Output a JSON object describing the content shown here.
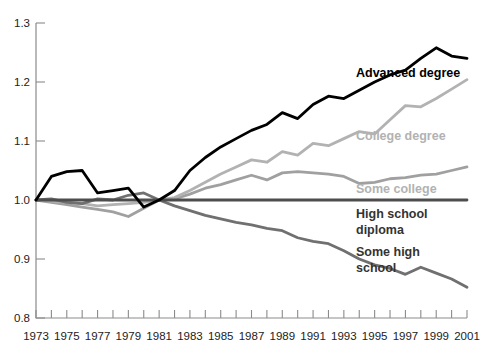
{
  "chart_data": {
    "type": "line",
    "title": "",
    "subtitle": "",
    "xlabel": "",
    "ylabel": "",
    "xlim": [
      1973,
      2001
    ],
    "ylim": [
      0.8,
      1.3
    ],
    "grid": false,
    "legend_position": "inline-right",
    "y_ticks": [
      "0.8",
      "0.9",
      "1.0",
      "1.1",
      "1.2",
      "1.3"
    ],
    "y_tick_values": [
      0.8,
      0.9,
      1.0,
      1.1,
      1.2,
      1.3
    ],
    "x_ticks": [
      "1973",
      "1975",
      "1977",
      "1979",
      "1981",
      "1983",
      "1985",
      "1987",
      "1989",
      "1991",
      "1993",
      "1995",
      "1997",
      "1999",
      "2001"
    ],
    "x_tick_values": [
      1973,
      1975,
      1977,
      1979,
      1981,
      1983,
      1985,
      1987,
      1989,
      1991,
      1993,
      1995,
      1997,
      1999,
      2001
    ],
    "x_minor_values": [
      1974,
      1976,
      1978,
      1980,
      1982,
      1984,
      1986,
      1988,
      1990,
      1992,
      1994,
      1996,
      1998,
      2000
    ],
    "x": [
      1973,
      1974,
      1975,
      1976,
      1977,
      1978,
      1979,
      1980,
      1981,
      1982,
      1983,
      1984,
      1985,
      1986,
      1987,
      1988,
      1989,
      1990,
      1991,
      1992,
      1993,
      1994,
      1995,
      1996,
      1997,
      1998,
      1999,
      2000,
      2001
    ],
    "series": [
      {
        "name": "Advanced degree",
        "color": "#000000",
        "label_color": "#000000",
        "width": 2.8,
        "label_x": 356,
        "label_y": 77,
        "values": [
          1.0,
          1.04,
          1.048,
          1.05,
          1.012,
          1.016,
          1.02,
          0.988,
          1.0,
          1.016,
          1.05,
          1.072,
          1.09,
          1.104,
          1.118,
          1.128,
          1.148,
          1.138,
          1.162,
          1.176,
          1.172,
          1.186,
          1.2,
          1.212,
          1.22,
          1.24,
          1.258,
          1.244,
          1.24
        ]
      },
      {
        "name": "College degree",
        "color": "#b2b2b2",
        "label_color": "#b2b2b2",
        "width": 2.8,
        "label_x": 356,
        "label_y": 140,
        "values": [
          1.0,
          0.998,
          0.996,
          0.994,
          0.99,
          0.992,
          0.994,
          0.996,
          1.0,
          1.004,
          1.016,
          1.03,
          1.044,
          1.056,
          1.068,
          1.064,
          1.082,
          1.076,
          1.096,
          1.092,
          1.104,
          1.116,
          1.112,
          1.136,
          1.16,
          1.158,
          1.172,
          1.188,
          1.204
        ]
      },
      {
        "name": "Some college",
        "color": "#a0a0a0",
        "label_color": "#b2b2b2",
        "width": 2.8,
        "label_x": 356,
        "label_y": 193,
        "values": [
          1.0,
          0.996,
          0.992,
          0.988,
          0.984,
          0.98,
          0.972,
          0.986,
          1.0,
          1.002,
          1.01,
          1.02,
          1.026,
          1.034,
          1.042,
          1.034,
          1.046,
          1.048,
          1.046,
          1.044,
          1.04,
          1.028,
          1.03,
          1.036,
          1.038,
          1.042,
          1.044,
          1.05,
          1.056
        ]
      },
      {
        "name": "High school diploma",
        "color": "#4d4d4d",
        "label_color": "#333333",
        "width": 2.8,
        "label_x": 356,
        "label_y": 218,
        "label_line2_y": 234,
        "values": [
          1.0,
          1.0,
          1.0,
          1.0,
          1.0,
          1.0,
          1.0,
          1.0,
          1.0,
          1.0,
          1.0,
          1.0,
          1.0,
          1.0,
          1.0,
          1.0,
          1.0,
          1.0,
          1.0,
          1.0,
          1.0,
          1.0,
          1.0,
          1.0,
          1.0,
          1.0,
          1.0,
          1.0,
          1.0
        ]
      },
      {
        "name": "Some high school",
        "color": "#707070",
        "label_color": "#333333",
        "width": 2.8,
        "label_x": 356,
        "label_y": 256,
        "label_line2_y": 272,
        "values": [
          1.0,
          1.002,
          0.996,
          0.994,
          1.002,
          1.0,
          1.008,
          1.012,
          1.0,
          0.99,
          0.982,
          0.974,
          0.968,
          0.962,
          0.958,
          0.952,
          0.948,
          0.936,
          0.93,
          0.926,
          0.914,
          0.9,
          0.89,
          0.884,
          0.874,
          0.886,
          0.876,
          0.866,
          0.852
        ]
      }
    ],
    "series_label_lines": [
      [
        "Advanced degree"
      ],
      [
        "College degree"
      ],
      [
        "Some college"
      ],
      [
        "High school",
        "diploma"
      ],
      [
        "Some high",
        "school"
      ]
    ]
  },
  "axes": {
    "axis_color": "#8b8b8b",
    "plot_left": 36,
    "plot_right": 467,
    "plot_top": 23,
    "plot_bottom": 318
  }
}
